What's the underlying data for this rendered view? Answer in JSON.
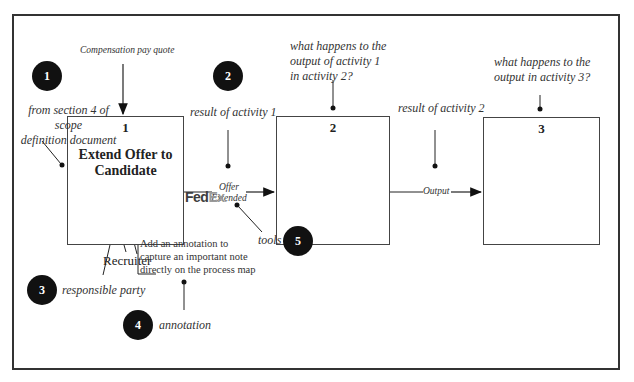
{
  "diagram": {
    "activities": [
      {
        "number": "1",
        "title": "Extend Offer to Candidate"
      },
      {
        "number": "2",
        "title": ""
      },
      {
        "number": "3",
        "title": ""
      }
    ],
    "input_label": "Compensation  pay quote",
    "flows": [
      {
        "label": "Offer Extended",
        "line1": "Offer",
        "line2": "Extended"
      },
      {
        "label": "Output"
      }
    ],
    "responsible_party": "Recruiter",
    "tool_logo": {
      "fed": "Fed",
      "ex": "Ex",
      "dot": "."
    },
    "annotation_note": {
      "line1": "Add an annotation to",
      "line2": "capture an important note",
      "line3": "directly on the process map"
    },
    "callouts": [
      {
        "badge": "1",
        "line1": "from section 4 of scope",
        "line2": "definition document"
      },
      {
        "badge": "2",
        "text": "result of activity 1"
      },
      {
        "badge": "3",
        "text": "responsible party"
      },
      {
        "badge": "4",
        "text": "annotation"
      },
      {
        "badge": "5",
        "text": "tools"
      }
    ],
    "questions": {
      "activity2": {
        "line1": "what happens to the",
        "line2": "output of activity 1",
        "line3": "in activity 2?"
      },
      "activity3": {
        "line1": "what happens to the",
        "line2": "output in activity 3?"
      },
      "result2": "result of activity 2"
    }
  }
}
